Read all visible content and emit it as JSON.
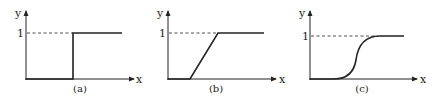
{
  "figure": {
    "panels": [
      {
        "id": "a",
        "caption": "(a)",
        "y_axis_label": "y",
        "x_axis_label": "x",
        "y_tick_label": "1",
        "curve_type": "step",
        "description": "Hard threshold (step) function: y = 0 then jumps to 1"
      },
      {
        "id": "b",
        "caption": "(b)",
        "y_axis_label": "y",
        "x_axis_label": "x",
        "y_tick_label": "1",
        "curve_type": "ramp",
        "description": "Piecewise linear (ramp) function: y = 0, linear rise, then saturates at 1"
      },
      {
        "id": "c",
        "caption": "(c)",
        "y_axis_label": "y",
        "x_axis_label": "x",
        "y_tick_label": "1",
        "curve_type": "sigmoid",
        "description": "Smooth S-shaped (sigmoid) function rising from 0 to 1"
      }
    ],
    "colors": {
      "ink": "#222222",
      "background": "#ffffff"
    }
  }
}
